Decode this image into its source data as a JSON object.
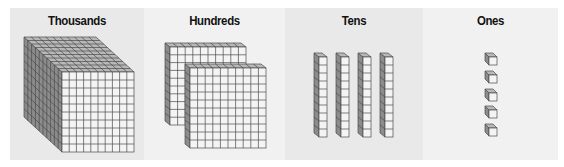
{
  "diagram": {
    "panels": [
      {
        "label": "Thousands",
        "block": "cube",
        "count": 1,
        "units_per_block": 1000
      },
      {
        "label": "Hundreds",
        "block": "flat",
        "count": 2,
        "units_per_block": 100
      },
      {
        "label": "Tens",
        "block": "rod",
        "count": 4,
        "units_per_block": 10
      },
      {
        "label": "Ones",
        "block": "unit",
        "count": 5,
        "units_per_block": 1
      }
    ],
    "colors": {
      "page_background": "#ffffff",
      "panel_dark": "#e9e9e9",
      "panel_light": "#f1f1f1",
      "face_front": "#f4f4f4",
      "face_top": "#b8b8b8",
      "face_side": "#8c8c8c",
      "grid_line": "#4a4a4a"
    }
  }
}
